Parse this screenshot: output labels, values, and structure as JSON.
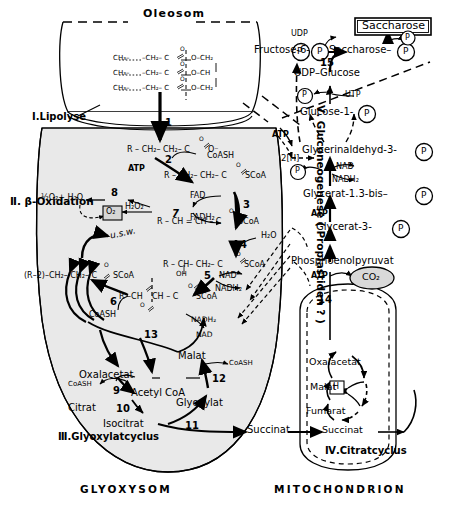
{
  "organelles": {
    "oleosom": "Oleosom",
    "glyoxysom": "GLYOXYSOM",
    "mitochondrion": "MITOCHONDRION"
  },
  "sections": {
    "lipolyse": "I.Lipolyse",
    "beta_oxidation": "Ⅱ. β-Oxidation",
    "glyoxylatcyclus": "Ⅲ.Glyoxylatcyclus",
    "citratcyclus": "Ⅳ.Citratcyclus",
    "gluconeogenese": "Ⅴ. Gluconeogenese ( Proplastiden ? )"
  },
  "triacylglycerol": {
    "rows": [
      {
        "chain": "CH₃–",
        "dots": "······",
        "mid": "–CH₂– C",
        "o": "O",
        "ester": "O–CH₂"
      },
      {
        "chain": "CH₃–",
        "dots": "······",
        "mid": "–CH₂– C",
        "o": "O",
        "ester": "O–CH"
      },
      {
        "chain": "CH₃–",
        "dots": "······",
        "mid": "–CH₂– C",
        "o": "O",
        "ester": "O–CH₂"
      }
    ]
  },
  "beta_ox": {
    "fatty_acid": "R – CH₂– CH₂– C",
    "fatty_acid_tail": "O⁻",
    "acyl_coa": "R – CH₂– CH₂– C",
    "acyl_coa_tail": "SCoA",
    "enoyl": "R – CH = CH – C",
    "enoyl_tail": "SCoA",
    "hydroxyacyl": "R – CH– CH₂– C",
    "hydroxyacyl_tail": "SCoA",
    "hydroxyl": "OH",
    "ketoacyl": "R –CH",
    "ketoacyl2": "CH – C",
    "ketoacyl_tail": "SCoA",
    "shortened": "(R–2)–CH₂– CH₂– C",
    "shortened_tail": "SCoA",
    "atp": "ATP",
    "coash1": "CoASH",
    "coash2": "CoASH",
    "fad": "FAD",
    "fadh2": "FADH₂",
    "h2o": "H₂O",
    "h2o2": "H₂O₂",
    "halfo2": "½O₂+ H₂O",
    "o2box": "O₂",
    "nad": "NAD",
    "nadh2": "NADH₂",
    "usw": "u.s.w.",
    "oxygen": "O"
  },
  "glyoxylate_cycle": {
    "oxalacetat": "Oxalacetat",
    "acetyl_coa": "Acetyl CoA",
    "citrat": "Citrat",
    "isocitrat": "Isocitrat",
    "succinat": "Succinat",
    "glyoxylat": "Glyoxylat",
    "malat": "Malat",
    "coash_left": "CoASH",
    "coash_right": "CoASH",
    "nad": "NAD",
    "nadh2": "NADH₂"
  },
  "citrate_cycle": {
    "oxalacetat": "Oxalacetat",
    "malat": "Malat",
    "fumarat": "Fumarat",
    "succinat": "Succinat",
    "hydrogen": "H",
    "co2": "CO₂"
  },
  "gluconeogenesis": {
    "saccharose_box": "Saccharose",
    "saccharose_p": "Saccharose–",
    "fructose6p": "Fructose-6-",
    "udp_glucose": "UDP–Glucose",
    "glucose1p": "Glucose-1-",
    "glycerinaldehyd": "Glycerinaldehyd-3-",
    "glycerat13": "Glycerat-1.3-bis–",
    "glycerat3": "Glycerat-3-",
    "pep": "Phosphoenolpyruvat",
    "udp": "UDP",
    "utp": "UTP",
    "nad": "NAD",
    "nadh2": "NADH₂",
    "atp1": "ATP",
    "atp2": "ATP",
    "atp3": "ATP",
    "two_h": "2[H]",
    "p": "P"
  },
  "step_numbers": {
    "s1": "1",
    "s2": "2",
    "s3": "3",
    "s4": "4",
    "s5": "5",
    "s6": "6",
    "s7": "7",
    "s8": "8",
    "s9": "9",
    "s10": "10",
    "s11": "11",
    "s12": "12",
    "s13": "13",
    "s14": "14",
    "s15": "15"
  },
  "colors": {
    "organelle_fill": "#e8e8e8",
    "stroke": "#000000",
    "co2_fill": "#d9d9d9"
  }
}
